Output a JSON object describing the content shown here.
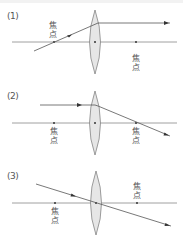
{
  "colors": {
    "line": "#555555",
    "axis": "#888888",
    "lens_fill": "#e6e6e6",
    "lens_stroke": "#777777",
    "text": "#555555"
  },
  "panels": [
    {
      "label": "(1)",
      "focus_label_chars": [
        "焦",
        "点"
      ],
      "description": "Ray passing through the front focal point exits parallel to the axis"
    },
    {
      "label": "(2)",
      "focus_label_chars": [
        "焦",
        "点"
      ],
      "description": "Ray parallel to the axis is refracted through the rear focal point"
    },
    {
      "label": "(3)",
      "focus_label_chars": [
        "焦",
        "点"
      ],
      "description": "Ray through the lens center travels straight"
    }
  ]
}
